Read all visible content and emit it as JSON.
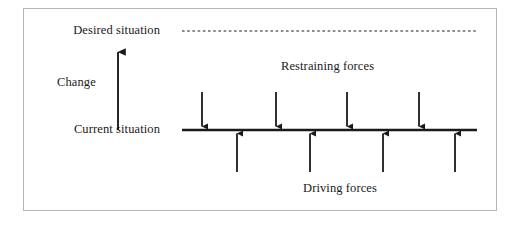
{
  "diagram": {
    "type": "force-field-analysis",
    "labels": {
      "desired_situation": "Desired situation",
      "current_situation": "Current situation",
      "change": "Change",
      "restraining_forces": "Restraining forces",
      "driving_forces": "Driving forces"
    },
    "colors": {
      "ink": "#1a1a1a",
      "frame": "#b4b4b4",
      "background": "#ffffff"
    },
    "geometry": {
      "frame": {
        "x": 23,
        "y": 8,
        "width": 474,
        "height": 203
      },
      "desired_line": {
        "x1": 182,
        "y1": 31,
        "x2": 477,
        "y2": 31,
        "style": "dashed"
      },
      "current_line": {
        "x1": 182,
        "y1": 130,
        "x2": 477,
        "y2": 130,
        "style": "solid"
      },
      "change_arrow": {
        "x": 118,
        "y_tail": 130,
        "y_head": 48,
        "direction": "up"
      }
    },
    "restraining_force_arrows": [
      {
        "x": 202,
        "y_tail": 92,
        "y_head": 130,
        "direction": "down"
      },
      {
        "x": 276,
        "y_tail": 92,
        "y_head": 130,
        "direction": "down"
      },
      {
        "x": 347,
        "y_tail": 92,
        "y_head": 130,
        "direction": "down"
      },
      {
        "x": 419,
        "y_tail": 92,
        "y_head": 130,
        "direction": "down"
      }
    ],
    "driving_force_arrows": [
      {
        "x": 237,
        "y_tail": 172,
        "y_head": 130,
        "direction": "up"
      },
      {
        "x": 310,
        "y_tail": 172,
        "y_head": 130,
        "direction": "up"
      },
      {
        "x": 383,
        "y_tail": 172,
        "y_head": 130,
        "direction": "up"
      },
      {
        "x": 455,
        "y_tail": 172,
        "y_head": 130,
        "direction": "up"
      }
    ]
  }
}
